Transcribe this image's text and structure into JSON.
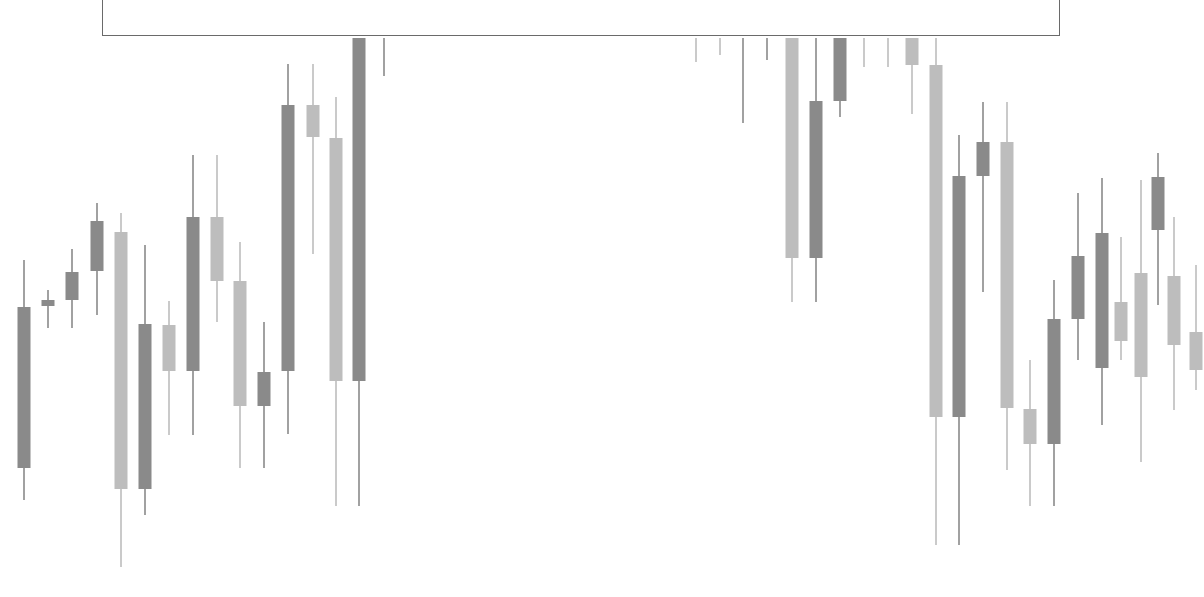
{
  "colors": {
    "background": "#ffffff",
    "dark_candle": "#8a8a8a",
    "light_candle": "#bdbdbd",
    "box_border": "#6a6a6a"
  },
  "overlay_box": {
    "label": ""
  },
  "chart_data": {
    "type": "candlestick",
    "title": "",
    "xlabel": "",
    "ylabel": "",
    "grid": false,
    "legend": null,
    "note": "Values are pixel y-coordinates (top=0). Lower y = higher price. Candles under the top box are clipped at y=38.",
    "candles": [
      {
        "x": 24,
        "high": 260,
        "body_top": 307,
        "body_bottom": 468,
        "low": 500,
        "color": "dark"
      },
      {
        "x": 48,
        "high": 290,
        "body_top": 300,
        "body_bottom": 306,
        "low": 328,
        "color": "dark"
      },
      {
        "x": 72,
        "high": 249,
        "body_top": 272,
        "body_bottom": 300,
        "low": 328,
        "color": "dark"
      },
      {
        "x": 97,
        "high": 203,
        "body_top": 221,
        "body_bottom": 271,
        "low": 315,
        "color": "dark"
      },
      {
        "x": 121,
        "high": 213,
        "body_top": 232,
        "body_bottom": 489,
        "low": 567,
        "color": "light"
      },
      {
        "x": 145,
        "high": 245,
        "body_top": 324,
        "body_bottom": 489,
        "low": 515,
        "color": "dark"
      },
      {
        "x": 169,
        "high": 301,
        "body_top": 325,
        "body_bottom": 371,
        "low": 435,
        "color": "light"
      },
      {
        "x": 193,
        "high": 155,
        "body_top": 217,
        "body_bottom": 371,
        "low": 435,
        "color": "dark"
      },
      {
        "x": 217,
        "high": 155,
        "body_top": 217,
        "body_bottom": 281,
        "low": 322,
        "color": "light"
      },
      {
        "x": 240,
        "high": 242,
        "body_top": 281,
        "body_bottom": 406,
        "low": 468,
        "color": "light"
      },
      {
        "x": 264,
        "high": 322,
        "body_top": 372,
        "body_bottom": 406,
        "low": 468,
        "color": "dark"
      },
      {
        "x": 288,
        "high": 64,
        "body_top": 105,
        "body_bottom": 371,
        "low": 434,
        "color": "dark"
      },
      {
        "x": 313,
        "high": 64,
        "body_top": 105,
        "body_bottom": 137,
        "low": 254,
        "color": "light"
      },
      {
        "x": 336,
        "high": 97,
        "body_top": 138,
        "body_bottom": 381,
        "low": 506,
        "color": "light"
      },
      {
        "x": 359,
        "high": 38,
        "body_top": 38,
        "body_bottom": 381,
        "low": 506,
        "color": "dark"
      },
      {
        "x": 384,
        "high": 38,
        "body_top": 38,
        "body_bottom": 38,
        "low": 76,
        "color": "dark"
      },
      {
        "x": 696,
        "high": 38,
        "body_top": 38,
        "body_bottom": 38,
        "low": 62,
        "color": "light"
      },
      {
        "x": 720,
        "high": 38,
        "body_top": 38,
        "body_bottom": 38,
        "low": 55,
        "color": "light"
      },
      {
        "x": 743,
        "high": 38,
        "body_top": 38,
        "body_bottom": 38,
        "low": 123,
        "color": "dark"
      },
      {
        "x": 767,
        "high": 38,
        "body_top": 38,
        "body_bottom": 38,
        "low": 60,
        "color": "dark"
      },
      {
        "x": 792,
        "high": 38,
        "body_top": 38,
        "body_bottom": 258,
        "low": 302,
        "color": "light"
      },
      {
        "x": 816,
        "high": 38,
        "body_top": 101,
        "body_bottom": 258,
        "low": 302,
        "color": "dark"
      },
      {
        "x": 840,
        "high": 38,
        "body_top": 38,
        "body_bottom": 101,
        "low": 117,
        "color": "dark"
      },
      {
        "x": 864,
        "high": 38,
        "body_top": 38,
        "body_bottom": 38,
        "low": 67,
        "color": "light"
      },
      {
        "x": 888,
        "high": 38,
        "body_top": 38,
        "body_bottom": 38,
        "low": 67,
        "color": "light"
      },
      {
        "x": 912,
        "high": 38,
        "body_top": 38,
        "body_bottom": 65,
        "low": 114,
        "color": "light"
      },
      {
        "x": 936,
        "high": 38,
        "body_top": 65,
        "body_bottom": 417,
        "low": 545,
        "color": "light"
      },
      {
        "x": 959,
        "high": 135,
        "body_top": 176,
        "body_bottom": 417,
        "low": 545,
        "color": "dark"
      },
      {
        "x": 983,
        "high": 102,
        "body_top": 142,
        "body_bottom": 176,
        "low": 292,
        "color": "dark"
      },
      {
        "x": 1007,
        "high": 102,
        "body_top": 142,
        "body_bottom": 408,
        "low": 470,
        "color": "light"
      },
      {
        "x": 1030,
        "high": 360,
        "body_top": 409,
        "body_bottom": 444,
        "low": 506,
        "color": "light"
      },
      {
        "x": 1054,
        "high": 280,
        "body_top": 319,
        "body_bottom": 444,
        "low": 506,
        "color": "dark"
      },
      {
        "x": 1078,
        "high": 193,
        "body_top": 256,
        "body_bottom": 319,
        "low": 360,
        "color": "dark"
      },
      {
        "x": 1102,
        "high": 178,
        "body_top": 233,
        "body_bottom": 368,
        "low": 425,
        "color": "dark"
      },
      {
        "x": 1121,
        "high": 237,
        "body_top": 302,
        "body_bottom": 341,
        "low": 360,
        "color": "light"
      },
      {
        "x": 1141,
        "high": 180,
        "body_top": 273,
        "body_bottom": 377,
        "low": 462,
        "color": "light"
      },
      {
        "x": 1158,
        "high": 153,
        "body_top": 177,
        "body_bottom": 230,
        "low": 305,
        "color": "dark"
      },
      {
        "x": 1174,
        "high": 217,
        "body_top": 276,
        "body_bottom": 345,
        "low": 410,
        "color": "light"
      },
      {
        "x": 1196,
        "high": 265,
        "body_top": 332,
        "body_bottom": 370,
        "low": 390,
        "color": "light"
      }
    ]
  }
}
